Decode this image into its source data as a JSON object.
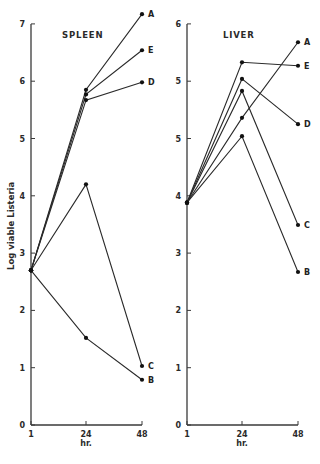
{
  "figure": {
    "ylabel": "Log viable Listeria",
    "xunit": "hr."
  },
  "chart_data": [
    {
      "type": "line",
      "title": "SPLEEN",
      "xlabel": "hr.",
      "ylabel": "Log viable Listeria",
      "x": [
        1,
        24,
        48
      ],
      "x_tick_labels": [
        "1",
        "24",
        "48"
      ],
      "y_tick_labels": [
        "0",
        "1",
        "2",
        "3",
        "4",
        "5",
        "6",
        "7"
      ],
      "ylim": [
        0,
        7
      ],
      "grid": false,
      "legend": "labels at line ends",
      "series": [
        {
          "name": "A",
          "values": [
            2.7,
            5.85,
            7.17
          ]
        },
        {
          "name": "E",
          "values": [
            2.7,
            5.77,
            6.54
          ]
        },
        {
          "name": "D",
          "values": [
            2.7,
            5.67,
            5.98
          ]
        },
        {
          "name": "C",
          "values": [
            2.7,
            4.2,
            1.03
          ]
        },
        {
          "name": "B",
          "values": [
            2.7,
            1.52,
            0.79
          ]
        }
      ]
    },
    {
      "type": "line",
      "title": "LIVER",
      "xlabel": "hr.",
      "ylabel": "",
      "x": [
        1,
        24,
        48
      ],
      "x_tick_labels": [
        "1",
        "24",
        "48"
      ],
      "y_tick_labels": [
        "0",
        "1",
        "2",
        "3",
        "4",
        "5",
        "5",
        "6"
      ],
      "ylim": [
        0,
        7
      ],
      "grid": false,
      "legend": "labels at line ends",
      "series": [
        {
          "name": "A",
          "values": [
            3.88,
            5.36,
            6.68
          ]
        },
        {
          "name": "E",
          "values": [
            3.88,
            6.33,
            6.27
          ]
        },
        {
          "name": "D",
          "values": [
            3.88,
            6.04,
            5.25
          ]
        },
        {
          "name": "C",
          "values": [
            3.88,
            5.83,
            3.49
          ]
        },
        {
          "name": "B",
          "values": [
            3.88,
            5.04,
            2.67
          ]
        }
      ]
    }
  ]
}
